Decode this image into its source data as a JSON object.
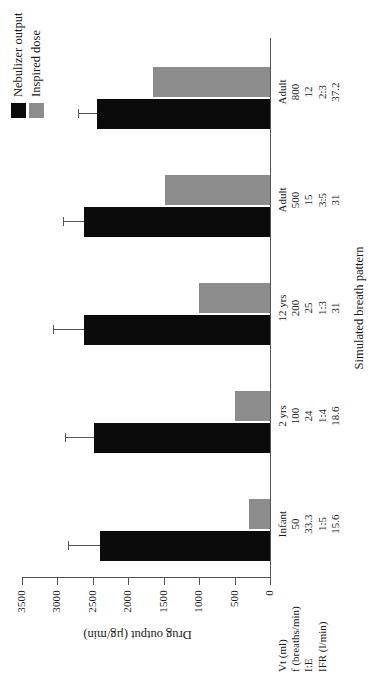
{
  "figure": {
    "title": "",
    "legend": {
      "items": [
        {
          "label": "Nebulizer output",
          "color": "#0b0b0b"
        },
        {
          "label": "Inspired dose",
          "color": "#8c8c8c"
        }
      ]
    },
    "row_headers": [
      "Vt (ml)",
      "f (breaths/min)",
      "I:E",
      "IFR (l/min)"
    ]
  },
  "chart_data": {
    "type": "bar",
    "orientation": "vertical-rendered-rotated",
    "title": "",
    "xlabel": "Simulated breath pattern",
    "ylabel": "Drug output (µg/min)",
    "ylim": [
      0,
      3500
    ],
    "yticks": [
      0,
      500,
      1000,
      1500,
      2000,
      2500,
      3000,
      3500
    ],
    "ytick_labels": [
      "0",
      "500",
      "1000",
      "1500",
      "2000",
      "2500",
      "3000",
      "3500"
    ],
    "grid": false,
    "legend_position": "top-right",
    "categories": [
      "Infant",
      "2 yrs",
      "12 yrs",
      "Adult",
      "Adult"
    ],
    "category_details": [
      {
        "name": "Infant",
        "Vt (ml)": "50",
        "f (breaths/min)": "33.3",
        "I:E": "1:5",
        "IFR (l/min)": "15.6"
      },
      {
        "name": "2 yrs",
        "Vt (ml)": "100",
        "f (breaths/min)": "24",
        "I:E": "1:4",
        "IFR (l/min)": "18.6"
      },
      {
        "name": "12 yrs",
        "Vt (ml)": "200",
        "f (breaths/min)": "25",
        "I:E": "1:3",
        "IFR (l/min)": "31"
      },
      {
        "name": "Adult",
        "Vt (ml)": "500",
        "f (breaths/min)": "15",
        "I:E": "3:5",
        "IFR (l/min)": "31"
      },
      {
        "name": "Adult",
        "Vt (ml)": "800",
        "f (breaths/min)": "12",
        "I:E": "2:3",
        "IFR (l/min)": "37.2"
      }
    ],
    "series": [
      {
        "name": "Nebulizer output",
        "color": "#0b0b0b",
        "values": [
          2400,
          2480,
          2620,
          2620,
          2440
        ],
        "errors": [
          450,
          420,
          440,
          300,
          270
        ]
      },
      {
        "name": "Inspired dose",
        "color": "#8c8c8c",
        "values": [
          300,
          500,
          1000,
          1480,
          1650
        ],
        "errors": [
          0,
          0,
          0,
          0,
          0
        ]
      }
    ]
  }
}
